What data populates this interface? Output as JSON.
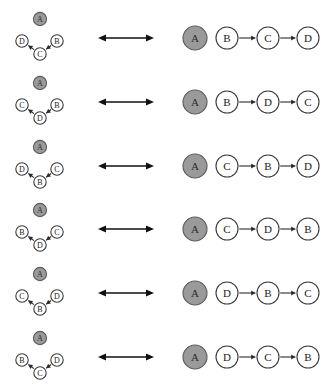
{
  "figure": {
    "background": "#ffffff",
    "node_fill_highlight": "#9a9a9a",
    "node_fill_plain": "#ffffff",
    "node_stroke": "#3a3a3a",
    "edge_color": "#2b2b2b",
    "equiv_arrow_label": "bidirectional-equivalence-arrow",
    "row_count": 6
  },
  "rows": [
    {
      "id": "row-1",
      "left_graph": {
        "isolated": "A",
        "left": "D",
        "right": "B",
        "bottom": "C",
        "edges": [
          {
            "from": "B",
            "to": "C"
          },
          {
            "from": "C",
            "to": "D"
          }
        ]
      },
      "right_side": {
        "isolated": "A",
        "chain": [
          "B",
          "C",
          "D"
        ],
        "chain_edges": [
          {
            "from": "B",
            "to": "C"
          },
          {
            "from": "C",
            "to": "D"
          }
        ]
      }
    },
    {
      "id": "row-2",
      "left_graph": {
        "isolated": "A",
        "left": "C",
        "right": "B",
        "bottom": "D",
        "edges": [
          {
            "from": "B",
            "to": "D"
          },
          {
            "from": "D",
            "to": "C"
          }
        ]
      },
      "right_side": {
        "isolated": "A",
        "chain": [
          "B",
          "D",
          "C"
        ],
        "chain_edges": [
          {
            "from": "B",
            "to": "D"
          },
          {
            "from": "D",
            "to": "C"
          }
        ]
      }
    },
    {
      "id": "row-3",
      "left_graph": {
        "isolated": "A",
        "left": "D",
        "right": "C",
        "bottom": "B",
        "edges": [
          {
            "from": "C",
            "to": "B"
          },
          {
            "from": "B",
            "to": "D"
          }
        ]
      },
      "right_side": {
        "isolated": "A",
        "chain": [
          "C",
          "B",
          "D"
        ],
        "chain_edges": [
          {
            "from": "C",
            "to": "B"
          },
          {
            "from": "B",
            "to": "D"
          }
        ]
      }
    },
    {
      "id": "row-4",
      "left_graph": {
        "isolated": "A",
        "left": "B",
        "right": "C",
        "bottom": "D",
        "edges": [
          {
            "from": "C",
            "to": "D"
          },
          {
            "from": "D",
            "to": "B"
          }
        ]
      },
      "right_side": {
        "isolated": "A",
        "chain": [
          "C",
          "D",
          "B"
        ],
        "chain_edges": [
          {
            "from": "C",
            "to": "D"
          },
          {
            "from": "D",
            "to": "B"
          }
        ]
      }
    },
    {
      "id": "row-5",
      "left_graph": {
        "isolated": "A",
        "left": "C",
        "right": "D",
        "bottom": "B",
        "edges": [
          {
            "from": "D",
            "to": "B"
          },
          {
            "from": "B",
            "to": "C"
          }
        ]
      },
      "right_side": {
        "isolated": "A",
        "chain": [
          "D",
          "B",
          "C"
        ],
        "chain_edges": [
          {
            "from": "D",
            "to": "B"
          },
          {
            "from": "B",
            "to": "C"
          }
        ]
      }
    },
    {
      "id": "row-6",
      "left_graph": {
        "isolated": "A",
        "left": "B",
        "right": "D",
        "bottom": "C",
        "edges": [
          {
            "from": "D",
            "to": "C"
          },
          {
            "from": "C",
            "to": "B"
          }
        ]
      },
      "right_side": {
        "isolated": "A",
        "chain": [
          "D",
          "C",
          "B"
        ],
        "chain_edges": [
          {
            "from": "D",
            "to": "C"
          },
          {
            "from": "C",
            "to": "B"
          }
        ]
      }
    }
  ]
}
